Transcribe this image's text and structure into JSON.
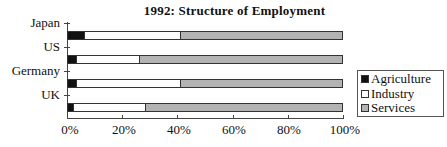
{
  "chart_data": {
    "type": "bar",
    "orientation": "horizontal",
    "stacked": "percent",
    "title": "1992:  Structure of Employment",
    "xlabel": "",
    "ylabel": "",
    "xlim": [
      0,
      100
    ],
    "x_ticks": [
      "0%",
      "20%",
      "40%",
      "60%",
      "80%",
      "100%"
    ],
    "categories": [
      "Japan",
      "US",
      "Germany",
      "UK"
    ],
    "series": [
      {
        "name": "Agriculture",
        "color": "#111111",
        "values": [
          6,
          3,
          3,
          2
        ]
      },
      {
        "name": "Industry",
        "color": "#ffffff",
        "values": [
          35,
          23,
          38,
          26
        ]
      },
      {
        "name": "Services",
        "color": "#b3b3b3",
        "values": [
          59,
          74,
          59,
          72
        ]
      }
    ],
    "grid": false,
    "legend_position": "right"
  },
  "title": "1992:  Structure of Employment",
  "y_labels": [
    "Japan",
    "US",
    "Germany",
    "UK"
  ],
  "x_labels": [
    "0%",
    "20%",
    "40%",
    "60%",
    "80%",
    "100%"
  ],
  "legend": [
    "Agriculture",
    "Industry",
    "Services"
  ]
}
